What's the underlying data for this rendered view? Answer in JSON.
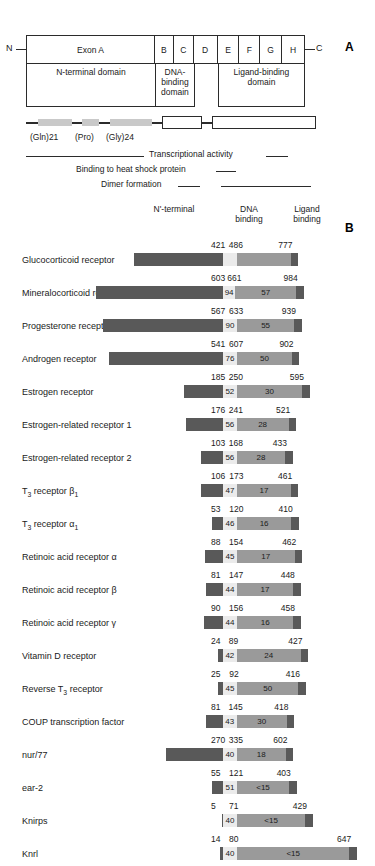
{
  "panel_a": {
    "letter": "A",
    "n_terminus": "N",
    "c_terminus": "C",
    "exons": [
      {
        "label": "Exon A",
        "width_pct": 46.2
      },
      {
        "label": "B",
        "width_pct": 6.8
      },
      {
        "label": "C",
        "width_pct": 7.2
      },
      {
        "label": "D",
        "width_pct": 8.6
      },
      {
        "label": "E",
        "width_pct": 7.9
      },
      {
        "label": "F",
        "width_pct": 7.5
      },
      {
        "label": "G",
        "width_pct": 7.9
      },
      {
        "label": "H",
        "width_pct": 7.9
      }
    ],
    "domains": [
      {
        "label": "N-terminal domain",
        "width_pct": 46.2
      },
      {
        "label": "DNA-\nbinding\ndomain",
        "width_pct": 14.0
      },
      {
        "label": "",
        "width_pct": 8.6
      },
      {
        "label": "Ligand-binding\ndomain",
        "width_pct": 31.2
      }
    ],
    "repeat_labels": [
      {
        "text": "(Gln)21",
        "left_px": 4
      },
      {
        "text": "(Pro)",
        "left_px": 49
      },
      {
        "text": "(Gly)24",
        "left_px": 80
      }
    ],
    "functions": [
      {
        "label": "Transcriptional activity",
        "name": "transcriptional-activity"
      },
      {
        "label": "Binding to heat shock protein",
        "name": "heat-shock-binding"
      },
      {
        "label": "Dimer formation",
        "name": "dimer-formation"
      }
    ]
  },
  "panel_b": {
    "letter": "B",
    "column_headers": {
      "nterminal": "N'-terminal",
      "dna": "DNA\nbinding",
      "ligand": "Ligand\nbinding"
    },
    "rows": [
      {
        "name": "Glucocorticoid receptor",
        "dbd_start": 421,
        "lbd_start": 486,
        "end": 777,
        "dbd_identity": "",
        "lbd_identity": "",
        "nterm_start": 1
      },
      {
        "name": "Mineralocorticoid receptor",
        "dbd_start": 603,
        "lbd_start": 661,
        "end": 984,
        "dbd_identity": "94",
        "lbd_identity": "57",
        "nterm_start": 1
      },
      {
        "name": "Progesterone receptor",
        "dbd_start": 567,
        "lbd_start": 633,
        "end": 939,
        "dbd_identity": "90",
        "lbd_identity": "55",
        "nterm_start": 1
      },
      {
        "name": "Androgen receptor",
        "dbd_start": 541,
        "lbd_start": 607,
        "end": 902,
        "dbd_identity": "76",
        "lbd_identity": "50",
        "nterm_start": 1
      },
      {
        "name": "Estrogen receptor",
        "dbd_start": 185,
        "lbd_start": 250,
        "end": 595,
        "dbd_identity": "52",
        "lbd_identity": "30",
        "nterm_start": 1
      },
      {
        "name": "Estrogen-related receptor 1",
        "dbd_start": 176,
        "lbd_start": 241,
        "end": 521,
        "dbd_identity": "56",
        "lbd_identity": "28",
        "nterm_start": 1
      },
      {
        "name": "Estrogen-related receptor 2",
        "dbd_start": 103,
        "lbd_start": 168,
        "end": 433,
        "dbd_identity": "56",
        "lbd_identity": "28",
        "nterm_start": 1
      },
      {
        "name": "T<sub>3</sub> receptor β<sub>1</sub>",
        "dbd_start": 106,
        "lbd_start": 173,
        "end": 461,
        "dbd_identity": "47",
        "lbd_identity": "17",
        "nterm_start": 1
      },
      {
        "name": "T<sub>3</sub> receptor α<sub>1</sub>",
        "dbd_start": 53,
        "lbd_start": 120,
        "end": 410,
        "dbd_identity": "46",
        "lbd_identity": "16",
        "nterm_start": 1
      },
      {
        "name": "Retinoic acid receptor α",
        "dbd_start": 88,
        "lbd_start": 154,
        "end": 462,
        "dbd_identity": "45",
        "lbd_identity": "17",
        "nterm_start": 1
      },
      {
        "name": "Retinoic acid receptor β",
        "dbd_start": 81,
        "lbd_start": 147,
        "end": 448,
        "dbd_identity": "44",
        "lbd_identity": "17",
        "nterm_start": 1
      },
      {
        "name": "Retinoic acid receptor γ",
        "dbd_start": 90,
        "lbd_start": 156,
        "end": 458,
        "dbd_identity": "44",
        "lbd_identity": "16",
        "nterm_start": 1
      },
      {
        "name": "Vitamin D receptor",
        "dbd_start": 24,
        "lbd_start": 89,
        "end": 427,
        "dbd_identity": "42",
        "lbd_identity": "24",
        "nterm_start": 1
      },
      {
        "name": "Reverse T<sub>3</sub> receptor",
        "dbd_start": 25,
        "lbd_start": 92,
        "end": 416,
        "dbd_identity": "45",
        "lbd_identity": "50",
        "nterm_start": 1
      },
      {
        "name": "COUP transcription factor",
        "dbd_start": 81,
        "lbd_start": 145,
        "end": 418,
        "dbd_identity": "43",
        "lbd_identity": "30",
        "nterm_start": 1
      },
      {
        "name": "nur/77",
        "dbd_start": 270,
        "lbd_start": 335,
        "end": 602,
        "dbd_identity": "40",
        "lbd_identity": "18",
        "nterm_start": 1
      },
      {
        "name": "ear-2",
        "dbd_start": 55,
        "lbd_start": 121,
        "end": 403,
        "dbd_identity": "51",
        "lbd_identity": "<15",
        "nterm_start": 1
      },
      {
        "name": "Knirps",
        "dbd_start": 5,
        "lbd_start": 71,
        "end": 429,
        "dbd_identity": "40",
        "lbd_identity": "<15",
        "nterm_start": 1
      },
      {
        "name": "Knrl",
        "dbd_start": 14,
        "lbd_start": 80,
        "end": 647,
        "dbd_identity": "40",
        "lbd_identity": "<15",
        "nterm_start": 1
      }
    ]
  },
  "chart_data": {
    "type": "bar",
    "subtitle": "Amino acid boundaries and percent identity relative to the glucocorticoid receptor",
    "xlabel": "Amino acid residue number",
    "ylabel": "Receptor",
    "categories": [
      "Glucocorticoid receptor",
      "Mineralocorticoid receptor",
      "Progesterone receptor",
      "Androgen receptor",
      "Estrogen receptor",
      "Estrogen-related receptor 1",
      "Estrogen-related receptor 2",
      "T3 receptor beta1",
      "T3 receptor alpha1",
      "Retinoic acid receptor alpha",
      "Retinoic acid receptor beta",
      "Retinoic acid receptor gamma",
      "Vitamin D receptor",
      "Reverse T3 receptor",
      "COUP transcription factor",
      "nur/77",
      "ear-2",
      "Knirps",
      "Knrl"
    ],
    "series": [
      {
        "name": "DNA-binding domain start (residue)",
        "values": [
          421,
          603,
          567,
          541,
          185,
          176,
          103,
          106,
          53,
          88,
          81,
          90,
          24,
          25,
          81,
          270,
          55,
          5,
          14
        ]
      },
      {
        "name": "Ligand-binding domain start (residue)",
        "values": [
          486,
          661,
          633,
          607,
          250,
          241,
          168,
          173,
          120,
          154,
          147,
          156,
          89,
          92,
          145,
          335,
          121,
          71,
          80
        ]
      },
      {
        "name": "C-terminal residue (total length)",
        "values": [
          777,
          984,
          939,
          902,
          595,
          521,
          433,
          461,
          410,
          462,
          448,
          458,
          427,
          416,
          418,
          602,
          403,
          429,
          647
        ]
      },
      {
        "name": "DNA-binding domain % identity",
        "values": [
          null,
          94,
          90,
          76,
          52,
          56,
          56,
          47,
          46,
          45,
          44,
          44,
          42,
          45,
          43,
          40,
          51,
          40,
          40
        ]
      },
      {
        "name": "Ligand-binding domain % identity",
        "values": [
          null,
          57,
          55,
          50,
          30,
          28,
          28,
          17,
          16,
          17,
          17,
          16,
          24,
          50,
          30,
          18,
          "<15",
          "<15",
          "<15"
        ]
      }
    ],
    "legend": [
      "N-terminal domain",
      "DNA binding",
      "Ligand binding"
    ],
    "colors": {
      "nterminal": "#595959",
      "dna_binding": "#ebebeb",
      "ligand_binding": "#9a9a9a"
    },
    "legend_position": "top",
    "grid": false,
    "xlim": [
      0,
      984
    ]
  }
}
